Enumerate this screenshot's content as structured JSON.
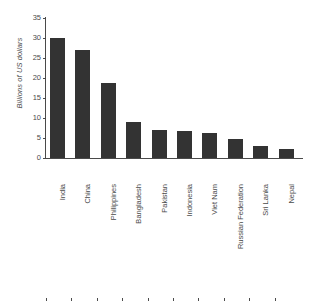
{
  "chart_data": {
    "type": "bar",
    "title": "",
    "subtitle": "",
    "xlabel": "",
    "ylabel": "Billions of US dollars",
    "ylim": [
      0,
      35
    ],
    "ytick_step": 5,
    "yticks": [
      0,
      5,
      10,
      15,
      20,
      25,
      30,
      35
    ],
    "ytick_labels": [
      "0",
      "5",
      "10",
      "15",
      "20",
      "25",
      "30",
      "35"
    ],
    "grid": false,
    "legend": null,
    "orientation": "vertical",
    "bar_color": "#333333",
    "axis_color": "#4a4a4a",
    "categories": [
      "India",
      "China",
      "Philippines",
      "Bangladesh",
      "Pakistan",
      "Indonesia",
      "Viet Nam",
      "Russian Federation",
      "Sri Lanka",
      "Nepal"
    ],
    "values": [
      30.0,
      27.1,
      18.8,
      9.0,
      7.1,
      6.8,
      6.2,
      4.8,
      3.1,
      2.2
    ],
    "series": [
      {
        "name": "Remittance inflows",
        "values": [
          30.0,
          27.1,
          18.8,
          9.0,
          7.1,
          6.8,
          6.2,
          4.8,
          3.1,
          2.2
        ]
      }
    ]
  }
}
